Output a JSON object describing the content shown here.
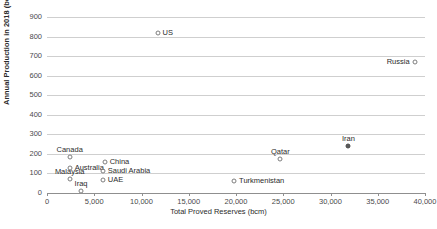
{
  "chart_data": {
    "type": "scatter",
    "title": "",
    "xlabel": "Total Proved Reserves (bcm)",
    "ylabel": "Annual Production in 2018 (bcm)",
    "xlim": [
      0,
      40000
    ],
    "ylim": [
      0,
      900
    ],
    "grid": true,
    "legend": "none",
    "xticks": [
      "0",
      "5,000",
      "10,000",
      "15,000",
      "20,000",
      "25,000",
      "30,000",
      "35,000",
      "40,000"
    ],
    "xtick_values": [
      0,
      5000,
      10000,
      15000,
      20000,
      25000,
      30000,
      35000,
      40000
    ],
    "yticks": [
      "0",
      "100",
      "200",
      "300",
      "400",
      "500",
      "600",
      "700",
      "800",
      "900"
    ],
    "ytick_values": [
      0,
      100,
      200,
      300,
      400,
      500,
      600,
      700,
      800,
      900
    ],
    "marker_style": "open-circle",
    "points": [
      {
        "label": "US",
        "x": 11700,
        "y": 820,
        "filled": false,
        "label_pos": "right"
      },
      {
        "label": "Russia",
        "x": 38900,
        "y": 670,
        "filled": false,
        "label_pos": "left"
      },
      {
        "label": "Iran",
        "x": 31900,
        "y": 240,
        "filled": true,
        "label_pos": "above"
      },
      {
        "label": "Qatar",
        "x": 24700,
        "y": 175,
        "filled": false,
        "label_pos": "above"
      },
      {
        "label": "Canada",
        "x": 2400,
        "y": 185,
        "filled": false,
        "label_pos": "above"
      },
      {
        "label": "China",
        "x": 6100,
        "y": 160,
        "filled": false,
        "label_pos": "right"
      },
      {
        "label": "Australia",
        "x": 2400,
        "y": 130,
        "filled": false,
        "label_pos": "right"
      },
      {
        "label": "Saudi Arabia",
        "x": 5900,
        "y": 112,
        "filled": false,
        "label_pos": "right"
      },
      {
        "label": "Malaysia",
        "x": 2400,
        "y": 73,
        "filled": false,
        "label_pos": "above"
      },
      {
        "label": "UAE",
        "x": 5900,
        "y": 65,
        "filled": false,
        "label_pos": "right"
      },
      {
        "label": "Turkmenistan",
        "x": 19800,
        "y": 62,
        "filled": false,
        "label_pos": "right"
      },
      {
        "label": "Iraq",
        "x": 3600,
        "y": 11,
        "filled": false,
        "label_pos": "above"
      }
    ]
  }
}
